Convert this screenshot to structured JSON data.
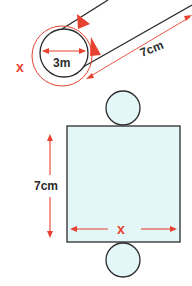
{
  "colors": {
    "outline": "#2b2b2b",
    "accent": "#e8412f",
    "fill": "#e3f6f8",
    "background": "#ffffff"
  },
  "cylinder": {
    "diameter_label": "3m",
    "length_label": "7cm",
    "circumference_label": "x"
  },
  "net": {
    "height_label": "7cm",
    "width_label": "x"
  }
}
